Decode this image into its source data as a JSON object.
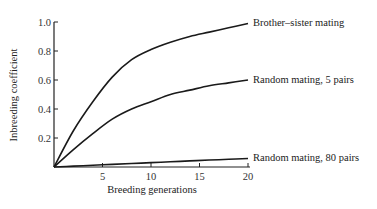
{
  "chart_data": {
    "type": "line",
    "title": "",
    "xlabel": "Breeding generations",
    "ylabel": "Inbreeding coefficient",
    "xlim": [
      0,
      20
    ],
    "ylim": [
      0,
      1.0
    ],
    "x_ticks": [
      5,
      10,
      15,
      20
    ],
    "y_ticks": [
      0.2,
      0.4,
      0.6,
      0.8,
      1.0
    ],
    "y_tick_labels": [
      "0.2",
      "0.4",
      "0.6",
      "0.8",
      "1.0"
    ],
    "x_tick_labels": [
      "5",
      "10",
      "15",
      "20"
    ],
    "grid": false,
    "legend": "inline labels at line ends (right)",
    "x": [
      0,
      2,
      4,
      6,
      8,
      10,
      12,
      14,
      16,
      18,
      20
    ],
    "series": [
      {
        "name": "Brother–sister mating",
        "values": [
          0,
          0.25,
          0.45,
          0.62,
          0.74,
          0.81,
          0.86,
          0.9,
          0.93,
          0.96,
          0.99
        ]
      },
      {
        "name": "Random mating, 5 pairs",
        "values": [
          0,
          0.12,
          0.23,
          0.33,
          0.4,
          0.45,
          0.5,
          0.53,
          0.56,
          0.58,
          0.6
        ]
      },
      {
        "name": "Random mating, 80 pairs",
        "values": [
          0,
          0.006,
          0.012,
          0.018,
          0.024,
          0.03,
          0.036,
          0.042,
          0.048,
          0.053,
          0.059
        ]
      }
    ]
  }
}
